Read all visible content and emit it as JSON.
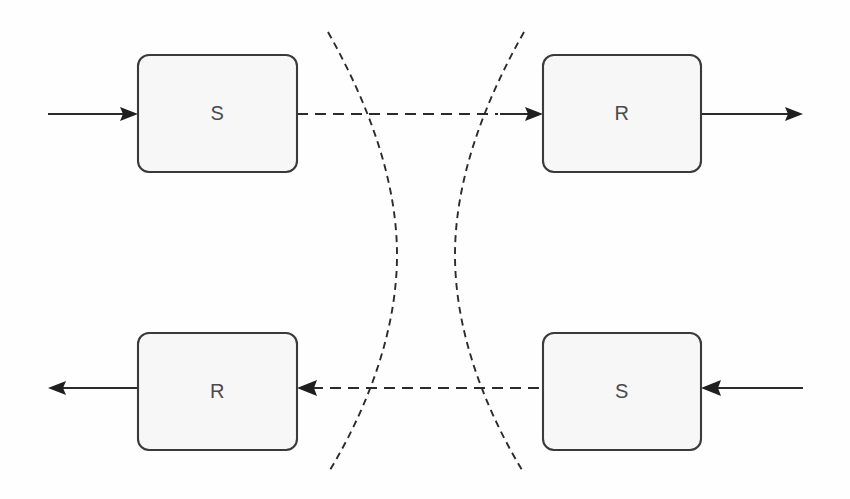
{
  "figure": {
    "type": "block-diagram",
    "background_color": "#fefefe",
    "line_color": "#2b2b2b",
    "box_fill_color": "#f7f7f7",
    "box_stroke_color": "#3a3a3a",
    "label_color": "#4a4a4a"
  },
  "nodes": [
    {
      "id": "top-left-sender",
      "label": "S",
      "x": 138,
      "y": 55,
      "width": 159,
      "height": 117,
      "radius": 11
    },
    {
      "id": "top-right-receiver",
      "label": "R",
      "x": 543,
      "y": 55,
      "width": 158,
      "height": 117,
      "radius": 11
    },
    {
      "id": "bottom-left-receiver",
      "label": "R",
      "x": 138,
      "y": 333,
      "width": 159,
      "height": 117,
      "radius": 11
    },
    {
      "id": "bottom-right-sender",
      "label": "S",
      "x": 543,
      "y": 333,
      "width": 158,
      "height": 117,
      "radius": 11
    }
  ],
  "connections": [
    {
      "id": "top-input-arrow",
      "style": "solid",
      "direction": "right",
      "y": 114,
      "x1": 48,
      "x2": 138
    },
    {
      "id": "top-sender-to-medium",
      "style": "dashed",
      "direction": "none",
      "y": 114,
      "x1": 297,
      "x2": 500
    },
    {
      "id": "top-medium-to-receiver",
      "style": "solid",
      "direction": "right",
      "y": 114,
      "x1": 500,
      "x2": 543
    },
    {
      "id": "top-output-arrow",
      "style": "solid",
      "direction": "right",
      "y": 114,
      "x1": 701,
      "x2": 803
    },
    {
      "id": "bottom-output-arrow",
      "style": "solid",
      "direction": "left",
      "y": 388,
      "x1": 138,
      "x2": 48
    },
    {
      "id": "bottom-medium-to-receiver",
      "style": "dashed",
      "direction": "left",
      "y": 388,
      "x1": 297,
      "x2": 512
    },
    {
      "id": "bottom-sender-to-medium",
      "style": "dashed",
      "direction": "none",
      "y": 388,
      "x1": 512,
      "x2": 543
    },
    {
      "id": "bottom-input-arrow",
      "style": "solid",
      "direction": "left",
      "y": 388,
      "x1": 803,
      "x2": 701
    }
  ],
  "medium_boundary": {
    "shape": "hourglass",
    "style": "dashed",
    "left_curve": {
      "top_x": 328,
      "top_y": 32,
      "waist_x": 397,
      "waist_y": 255,
      "bottom_x": 330,
      "bottom_y": 470
    },
    "right_curve": {
      "top_x": 524,
      "top_y": 32,
      "waist_x": 455,
      "waist_y": 255,
      "bottom_x": 522,
      "bottom_y": 470
    }
  }
}
